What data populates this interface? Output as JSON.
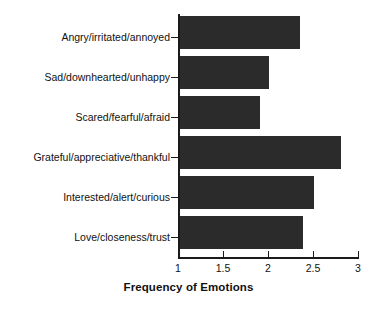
{
  "chart_data": {
    "type": "bar",
    "orientation": "horizontal",
    "title": "",
    "xlabel": "Frequency of Emotions",
    "ylabel": "",
    "xlim": [
      1,
      3
    ],
    "xticks": [
      "1",
      "1.5",
      "2",
      "2.5",
      "3"
    ],
    "xtick_values": [
      1,
      1.5,
      2,
      2.5,
      3
    ],
    "grid": false,
    "legend": false,
    "bar_color": "#2b2b2b",
    "categories": [
      "Angry/irritated/annoyed",
      "Sad/downhearted/unhappy",
      "Scared/fearful/afraid",
      "Grateful/appreciative/thankful",
      "Interested/alert/curious",
      "Love/closeness/trust"
    ],
    "values": [
      2.34,
      2.0,
      1.9,
      2.8,
      2.5,
      2.38
    ]
  }
}
